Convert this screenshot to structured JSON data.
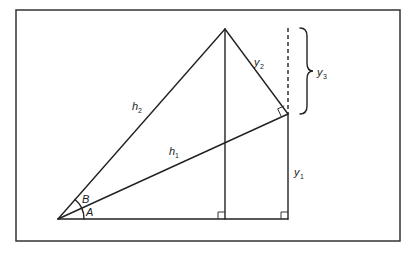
{
  "diagram": {
    "title": "",
    "points": {
      "origin": {
        "x": 58,
        "y": 219
      },
      "apex": {
        "x": 225,
        "y": 29
      },
      "right_vertex": {
        "x": 288,
        "y": 114
      },
      "foot_apex": {
        "x": 225,
        "y": 219
      },
      "foot_right": {
        "x": 288,
        "y": 219
      }
    },
    "labels": {
      "h1": {
        "main": "h",
        "sub": "1"
      },
      "h2": {
        "main": "h",
        "sub": "2"
      },
      "y1": {
        "main": "y",
        "sub": "1"
      },
      "y2": {
        "main": "y",
        "sub": "2"
      },
      "y3": {
        "main": "y",
        "sub": "3"
      },
      "angle_a": "A",
      "angle_b": "B"
    },
    "colors": {
      "line": "#222222",
      "frame": "#333333",
      "background": "#ffffff"
    }
  }
}
